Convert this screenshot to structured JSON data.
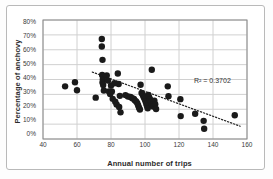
{
  "chart_data": {
    "type": "scatter",
    "title": "",
    "xlabel": "Annual number of trips",
    "ylabel": "Percentage of anchovy",
    "xlim": [
      40,
      160
    ],
    "ylim": [
      0,
      0.8
    ],
    "xticks": [
      "40",
      "60",
      "80",
      "100",
      "120",
      "140",
      "160"
    ],
    "xtick_values": [
      40,
      60,
      80,
      100,
      120,
      140,
      160
    ],
    "yticks": [
      "0%",
      "10%",
      "20%",
      "30%",
      "40%",
      "50%",
      "60%",
      "70%",
      "80%"
    ],
    "ytick_values": [
      0,
      10,
      20,
      30,
      40,
      50,
      60,
      70,
      80
    ],
    "grid": true,
    "legend": "none",
    "annotations": [
      {
        "name": "r-squared",
        "text": "R² = 0.3702",
        "x": 128,
        "y": 35.5
      }
    ],
    "trendline": {
      "type": "linear-dotted",
      "x_start": 69,
      "y_start": 45.0,
      "x_end": 156,
      "y_end": 8.6,
      "color": "#262626",
      "style": "dotted"
    },
    "marker": {
      "shape": "circle",
      "color": "#1a1a1a",
      "size": 3.2
    },
    "points": [
      [
        53.0,
        35.4
      ],
      [
        58.8,
        38.2
      ],
      [
        60.0,
        32.8
      ],
      [
        71.0,
        27.8
      ],
      [
        74.6,
        67.2
      ],
      [
        74.6,
        62.2
      ],
      [
        75.0,
        53.2
      ],
      [
        74.8,
        43.0
      ],
      [
        75.2,
        40.2
      ],
      [
        75.0,
        38.0
      ],
      [
        75.4,
        36.3
      ],
      [
        75.8,
        32.6
      ],
      [
        77.5,
        42.8
      ],
      [
        78.2,
        39.3
      ],
      [
        78.8,
        31.9
      ],
      [
        79.5,
        30.3
      ],
      [
        80.0,
        36.0
      ],
      [
        80.5,
        32.0
      ],
      [
        81.0,
        27.0
      ],
      [
        82.0,
        37.5
      ],
      [
        82.5,
        25.0
      ],
      [
        83.3,
        23.2
      ],
      [
        84.0,
        44.0
      ],
      [
        84.5,
        37.0
      ],
      [
        84.8,
        21.5
      ],
      [
        85.2,
        29.0
      ],
      [
        85.6,
        17.9
      ],
      [
        88.5,
        29.5
      ],
      [
        90.0,
        28.6
      ],
      [
        91.5,
        28.2
      ],
      [
        92.5,
        27.4
      ],
      [
        93.5,
        27.0
      ],
      [
        94.0,
        26.0
      ],
      [
        94.8,
        25.2
      ],
      [
        95.5,
        24.0
      ],
      [
        96.0,
        22.5
      ],
      [
        96.5,
        21.0
      ],
      [
        97.0,
        19.8
      ],
      [
        97.4,
        36.5
      ],
      [
        98.0,
        31.0
      ],
      [
        98.6,
        30.0
      ],
      [
        99.0,
        28.8
      ],
      [
        99.5,
        27.6
      ],
      [
        100.0,
        26.4
      ],
      [
        100.4,
        25.0
      ],
      [
        100.8,
        23.6
      ],
      [
        101.2,
        22.2
      ],
      [
        101.6,
        20.6
      ],
      [
        102.0,
        29.6
      ],
      [
        102.5,
        28.0
      ],
      [
        103.0,
        26.6
      ],
      [
        103.4,
        25.4
      ],
      [
        103.8,
        24.2
      ],
      [
        104.2,
        23.0
      ],
      [
        104.8,
        21.8
      ],
      [
        104.0,
        46.6
      ],
      [
        105.5,
        25.8
      ],
      [
        106.0,
        23.4
      ],
      [
        106.5,
        20.2
      ],
      [
        113.4,
        35.4
      ],
      [
        113.8,
        28.8
      ],
      [
        120.8,
        26.8
      ],
      [
        121.0,
        15.4
      ],
      [
        129.5,
        17.0
      ],
      [
        134.5,
        12.2
      ],
      [
        134.8,
        6.9
      ],
      [
        152.8,
        16.0
      ]
    ]
  },
  "figure": {
    "background": "#ffffff",
    "plot_border_color": "#808080",
    "grid_color": "#d0d0d0",
    "text_color": "#2b2b2b"
  }
}
